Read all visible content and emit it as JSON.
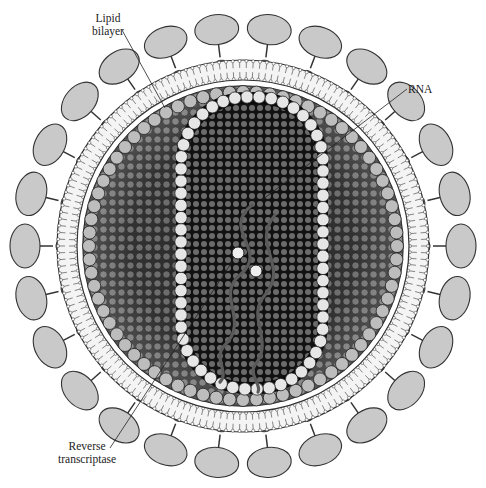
{
  "diagram": {
    "labels": [
      {
        "id": "lipid-bilayer",
        "line1": "Lipid",
        "line2": "bilayer"
      },
      {
        "id": "rna",
        "line1": "RNA"
      },
      {
        "id": "reverse-transcriptase",
        "line1": "Reverse",
        "line2": "transcriptase"
      }
    ]
  },
  "colors": {
    "background": "#ffffff",
    "glycoprotein_fill": "#c9c9c9",
    "outline": "#333333",
    "matrix_dark": "#2a2a2a",
    "sphere_light": "#e6e6e6",
    "rna_strand": "#555555"
  }
}
